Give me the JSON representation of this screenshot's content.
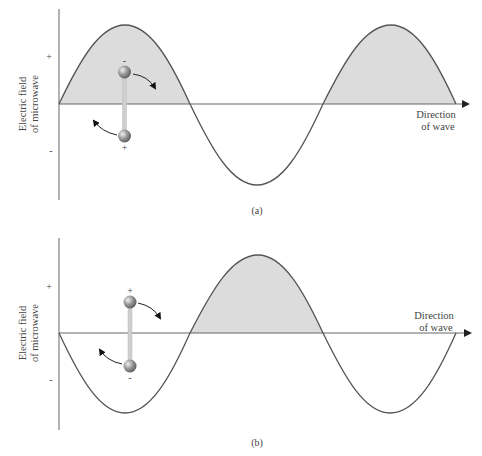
{
  "colors": {
    "background": "#ffffff",
    "wave_line": "#555555",
    "axis_line": "#666666",
    "shade_fill": "#dcdcdc",
    "rod": "#c8c8c8",
    "atom": "#8a8a8a"
  },
  "panels": [
    {
      "id": "a",
      "caption": "(a)",
      "y_axis_label_line1": "Electric field",
      "y_axis_label_line2": "of microwave",
      "plus_label": "+",
      "minus_label": "-",
      "direction_line1": "Direction",
      "direction_line2": "of wave",
      "wave_start_phase": "up",
      "molecule": {
        "top_charge": "-",
        "bottom_charge": "+",
        "rotation": "clockwise"
      }
    },
    {
      "id": "b",
      "caption": "(b)",
      "y_axis_label_line1": "Electric field",
      "y_axis_label_line2": "of microwave",
      "plus_label": "+",
      "minus_label": "-",
      "direction_line1": "Direction",
      "direction_line2": "of wave",
      "wave_start_phase": "down",
      "molecule": {
        "top_charge": "+",
        "bottom_charge": "-",
        "rotation": "clockwise"
      }
    }
  ]
}
